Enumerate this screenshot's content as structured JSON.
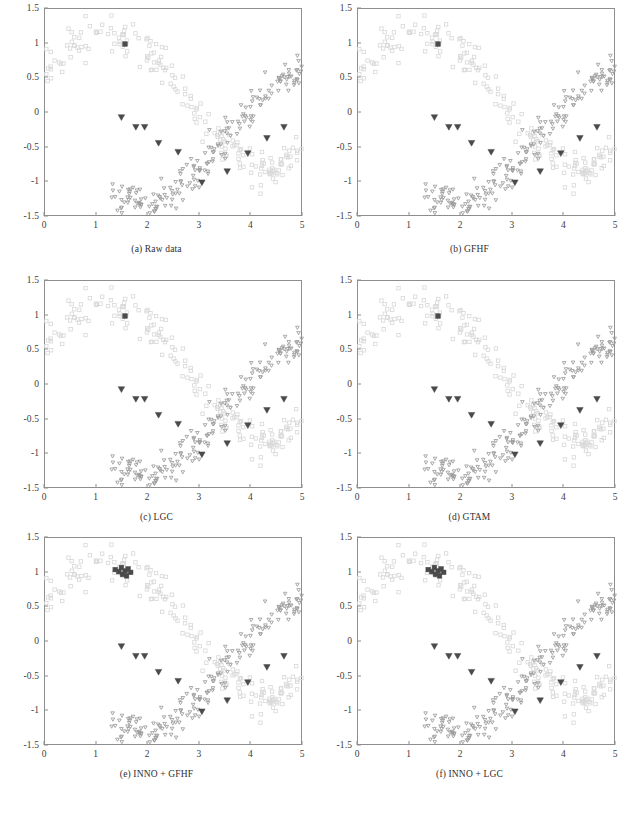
{
  "figure": {
    "type": "multi-panel-scatter-figure",
    "rows": 3,
    "cols": 2
  },
  "panels": [
    {
      "id": "a",
      "caption": "(a)  Raw data",
      "key": "raw"
    },
    {
      "id": "b",
      "caption": "(b)  GFHF",
      "key": "gfhf"
    },
    {
      "id": "c",
      "caption": "(c)  LGC",
      "key": "lgc"
    },
    {
      "id": "d",
      "caption": "(d)  GTAM",
      "key": "gtam"
    },
    {
      "id": "e",
      "caption": "(e)  INNO + GFHF",
      "key": "inno_gfhf"
    },
    {
      "id": "f",
      "caption": "(f)  INNO + LGC",
      "key": "inno_lgc"
    }
  ],
  "axes": {
    "xlim": [
      0,
      5
    ],
    "ylim": [
      -1.5,
      1.5
    ],
    "xticks": [
      0,
      1,
      2,
      3,
      4,
      5
    ],
    "xtick_labels": [
      "0",
      "1",
      "2",
      "3",
      "4",
      "5"
    ],
    "yticks": [
      1.5,
      1,
      0.5,
      0,
      -0.5,
      -1,
      -1.5
    ],
    "ytick_labels": [
      "1.5",
      "1",
      "0.5",
      "0",
      "-0.5",
      "-1",
      "-1.5"
    ],
    "grid": false,
    "xlabel": "",
    "ylabel": ""
  },
  "colors": {
    "class_a_marker": "#d9d9d9",
    "class_b_marker": "#9c9c9c",
    "labeled_marker": "#4a4a4a",
    "axis": "#8e8e8e",
    "text": "#3a3a3a",
    "background": "#ffffff"
  },
  "markers": {
    "class_a": {
      "shape": "square-open",
      "size": 3.4,
      "stroke": "#d9d9d9",
      "fill": "none",
      "label": "class-1 unlabeled"
    },
    "class_b": {
      "shape": "triangle-down-open",
      "size": 3.6,
      "stroke": "#9c9c9c",
      "fill": "none",
      "label": "class-2 unlabeled"
    },
    "labeled_a": {
      "shape": "square-filled",
      "size": 4.6,
      "fill": "#4a4a4a",
      "label": "class-1 labeled"
    },
    "labeled_b": {
      "shape": "triangle-down-filled",
      "size": 6.5,
      "fill": "#4a4a4a",
      "label": "class-2 labeled"
    }
  },
  "chart_data": {
    "type": "scatter",
    "title": "",
    "xlabel": "",
    "ylabel": "",
    "xlim": [
      0,
      5
    ],
    "ylim": [
      -1.5,
      1.5
    ],
    "xticks": [
      0,
      1,
      2,
      3,
      4,
      5
    ],
    "yticks": [
      -1.5,
      -1,
      -0.5,
      0,
      0.5,
      1,
      1.5
    ],
    "grid": false,
    "legend": "none",
    "series": [
      {
        "name": "class-1 unlabeled (upper arc)",
        "marker": "square-open",
        "color": "#d9d9d9",
        "n_points": 190,
        "generator": "y = sin(x + 0.35) * 0.95 + 0.18 + noise(0.16), x in [0, 5]",
        "x_range": [
          0.0,
          5.0
        ],
        "y_range": [
          -0.05,
          1.32
        ]
      },
      {
        "name": "class-2 unlabeled (lower arc)",
        "marker": "triangle-down-open",
        "color": "#9c9c9c",
        "n_points": 190,
        "generator": "y = sin(x + 0.35 + 2.45) * 0.95 - 0.38 + noise(0.16), x in [1.3, 5.0]",
        "x_range": [
          1.3,
          5.0
        ],
        "y_range": [
          -1.3,
          0.42
        ]
      },
      {
        "name": "class-1 labeled seeds",
        "marker": "square-filled",
        "color": "#4a4a4a",
        "points_raw": [
          [
            1.57,
            0.98
          ]
        ],
        "points_inno": [
          [
            1.38,
            1.03
          ],
          [
            1.45,
            1.0
          ],
          [
            1.5,
            1.06
          ],
          [
            1.52,
            0.96
          ],
          [
            1.57,
            1.01
          ],
          [
            1.6,
            0.94
          ],
          [
            1.63,
            1.04
          ],
          [
            1.68,
            0.99
          ]
        ]
      },
      {
        "name": "class-2 labeled seeds",
        "marker": "triangle-down-filled",
        "color": "#4a4a4a",
        "points": [
          [
            1.5,
            -0.08
          ],
          [
            1.78,
            -0.22
          ],
          [
            1.95,
            -0.22
          ],
          [
            2.22,
            -0.45
          ],
          [
            2.6,
            -0.58
          ],
          [
            3.06,
            -1.02
          ],
          [
            3.55,
            -0.86
          ],
          [
            3.95,
            -0.6
          ],
          [
            4.32,
            -0.38
          ],
          [
            4.65,
            -0.22
          ]
        ]
      }
    ]
  }
}
